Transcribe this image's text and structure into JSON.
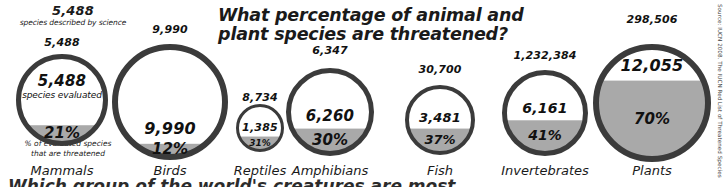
{
  "title": {
    "line1": "What percentage of animal and",
    "line2": "plant species are threatened?"
  },
  "annotations": {
    "top_number": "5,488",
    "top_caption": "species described by science",
    "bottom_caption_line1": "% of evaluated species",
    "bottom_caption_line2": "that are threatened"
  },
  "colors": {
    "ring": "#3b3b3b",
    "fill_threatened": "#a9a9a9",
    "fill_remainder": "#ffffff",
    "text": "#111111"
  },
  "source": "Source: IUCN 2008. The IUCN Red List of Threatened Species",
  "cutoff_headline": "Which group of the world's creatures are most",
  "chart_data": {
    "type": "pie",
    "title": "What percentage of animal and plant species are threatened?",
    "subtitle": "",
    "xlabel": "",
    "ylabel": "",
    "legend": [
      "species described by science",
      "species evaluated",
      "% of evaluated species that are threatened"
    ],
    "categories": [
      "Mammals",
      "Birds",
      "Reptiles",
      "Amphibians",
      "Fish",
      "Invertebrates",
      "Plants"
    ],
    "series": [
      {
        "name": "species described by science",
        "values": [
          5488,
          9990,
          8734,
          6347,
          30700,
          1232384,
          298506
        ]
      },
      {
        "name": "species evaluated",
        "values": [
          5488,
          9990,
          1385,
          6260,
          3481,
          6161,
          12055
        ]
      },
      {
        "name": "percent threatened",
        "values": [
          21,
          12,
          31,
          30,
          37,
          41,
          70
        ]
      }
    ]
  },
  "groups": [
    {
      "name": "mammals",
      "described": "5,488",
      "evaluated": "5,488",
      "percent": "21%",
      "label": "Mammals",
      "eval_note": "species evaluated"
    },
    {
      "name": "birds",
      "described": "9,990",
      "evaluated": "9,990",
      "percent": "12%",
      "label": "Birds",
      "eval_note": ""
    },
    {
      "name": "reptiles",
      "described": "8,734",
      "evaluated": "1,385",
      "percent": "31%",
      "label": "Reptiles",
      "eval_note": ""
    },
    {
      "name": "amphibians",
      "described": "6,347",
      "evaluated": "6,260",
      "percent": "30%",
      "label": "Amphibians",
      "eval_note": ""
    },
    {
      "name": "fish",
      "described": "30,700",
      "evaluated": "3,481",
      "percent": "37%",
      "label": "Fish",
      "eval_note": ""
    },
    {
      "name": "invertebrates",
      "described": "1,232,384",
      "evaluated": "6,161",
      "percent": "41%",
      "label": "Invertebrates",
      "eval_note": ""
    },
    {
      "name": "plants",
      "described": "298,506",
      "evaluated": "12,055",
      "percent": "70%",
      "label": "Plants",
      "eval_note": ""
    }
  ]
}
